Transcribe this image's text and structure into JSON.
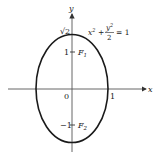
{
  "diagram": {
    "equation": {
      "x_term": "x",
      "x_exp": "2",
      "plus": "+",
      "num": "y",
      "num_exp": "2",
      "den": "2",
      "equals": "= 1"
    },
    "axes": {
      "x_label": "x",
      "y_label": "y"
    },
    "ticks": {
      "origin": "0",
      "x_one": "1",
      "y_top": "√2",
      "y_one": "1",
      "y_neg_one": "−1"
    },
    "foci": {
      "f1": "F",
      "f1_sub": "1",
      "f2": "F",
      "f2_sub": "2"
    },
    "colors": {
      "stroke": "#1a1a1a",
      "axis": "#555555"
    }
  }
}
